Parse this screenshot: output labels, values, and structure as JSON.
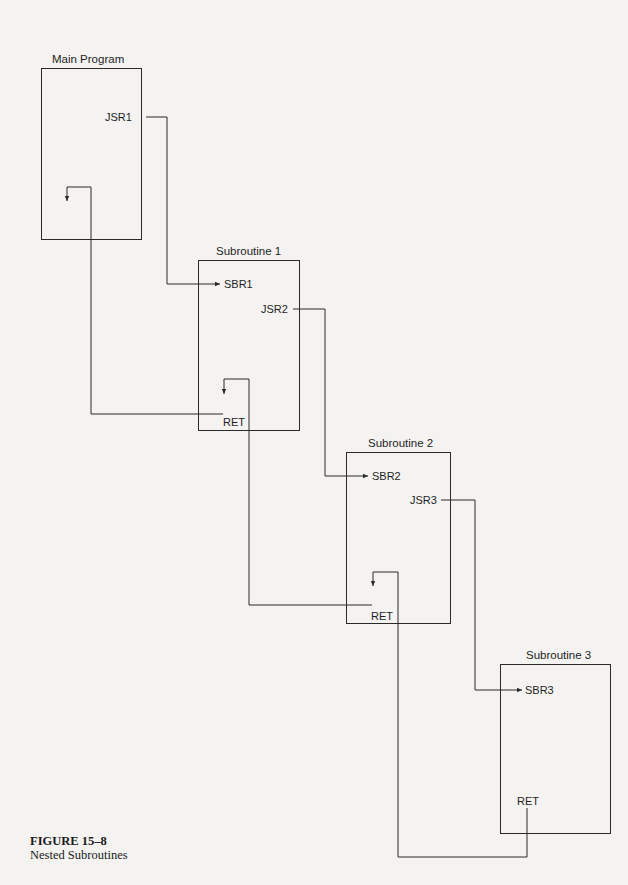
{
  "diagram": {
    "blocks": {
      "main": {
        "title": "Main Program",
        "labels": {
          "jsr": "JSR1"
        }
      },
      "sub1": {
        "title": "Subroutine 1",
        "labels": {
          "entry": "SBR1",
          "jsr": "JSR2",
          "ret": "RET"
        }
      },
      "sub2": {
        "title": "Subroutine 2",
        "labels": {
          "entry": "SBR2",
          "jsr": "JSR3",
          "ret": "RET"
        }
      },
      "sub3": {
        "title": "Subroutine 3",
        "labels": {
          "entry": "SBR3",
          "ret": "RET"
        }
      }
    },
    "flows": [
      {
        "from": "JSR1",
        "to": "SBR1",
        "type": "call"
      },
      {
        "from": "JSR2",
        "to": "SBR2",
        "type": "call"
      },
      {
        "from": "JSR3",
        "to": "SBR3",
        "type": "call"
      },
      {
        "from": "Subroutine 3 RET",
        "to": "Subroutine 2 (after JSR3)",
        "type": "return"
      },
      {
        "from": "Subroutine 2 RET",
        "to": "Subroutine 1 (after JSR2)",
        "type": "return"
      },
      {
        "from": "Subroutine 1 RET",
        "to": "Main Program (after JSR1)",
        "type": "return"
      }
    ],
    "line_color": "#2a2a2a"
  },
  "caption": {
    "number": "FIGURE 15–8",
    "title": "Nested Subroutines"
  }
}
